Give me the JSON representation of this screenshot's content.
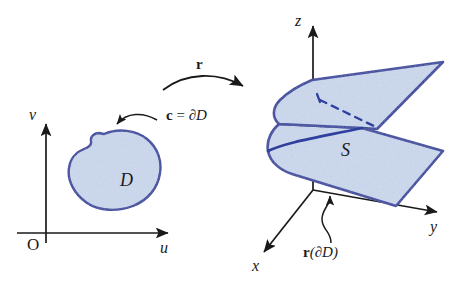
{
  "figure": {
    "caption_topic": "parametrization-of-surface",
    "colors": {
      "region_fill": "#ccd9ef",
      "region_outline": "#2f3f9e",
      "surface_fill": "#ccd9ef",
      "surface_outline": "#2f3f9e",
      "axis": "#1a1a1a",
      "text": "#1a1a1a",
      "background": "#ffffff"
    }
  },
  "uv_plane": {
    "v_axis_label": "v",
    "u_axis_label": "u",
    "origin_label": "O",
    "region_label": "D",
    "boundary_label_c": "c",
    "boundary_label_eq": " = ",
    "boundary_label_dD": "∂D"
  },
  "map": {
    "label": "r"
  },
  "xyz_space": {
    "z_axis_label": "z",
    "y_axis_label": "y",
    "x_axis_label": "x",
    "surface_label": "S",
    "image_boundary_label_r": "r",
    "image_boundary_label_paren": "(∂D)"
  }
}
